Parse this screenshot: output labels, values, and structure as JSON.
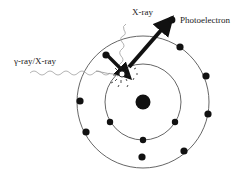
{
  "figure": {
    "background_color": "#ffffff",
    "ink_color": "#1a1a1a",
    "faint_ray_color": "#aaaaaa",
    "orbit_color": "#555555"
  },
  "labels": {
    "incident_photon": "γ-ray/X-ray",
    "emitted_photon": "X-ray",
    "photoelectron": "Photoelectron"
  },
  "legend": {
    "photoelectron_marker": "filled-dot"
  },
  "atom": {
    "nucleus": {
      "cx": 143,
      "cy": 102,
      "r": 7.5,
      "fill": "#111111"
    },
    "shells": [
      {
        "name": "inner-shell",
        "cx": 143,
        "cy": 102,
        "rx": 38,
        "ry": 38
      },
      {
        "name": "outer-shell",
        "cx": 143,
        "cy": 102,
        "rx": 66,
        "ry": 66
      }
    ],
    "inner_electrons": [
      {
        "cx": 175,
        "cy": 122,
        "r": 3.2
      },
      {
        "cx": 143,
        "cy": 140,
        "r": 3.2
      },
      {
        "cx": 110,
        "cy": 122,
        "r": 3.2
      }
    ],
    "outer_electrons": [
      {
        "cx": 180,
        "cy": 47,
        "r": 3.6
      },
      {
        "cx": 206,
        "cy": 76,
        "r": 3.6
      },
      {
        "cx": 208,
        "cy": 114,
        "r": 3.6
      },
      {
        "cx": 184,
        "cy": 151,
        "r": 3.6
      },
      {
        "cx": 142,
        "cy": 157,
        "r": 3.6
      },
      {
        "cx": 86,
        "cy": 132,
        "r": 3.6
      },
      {
        "cx": 80,
        "cy": 101,
        "r": 3.6
      },
      {
        "cx": 106,
        "cy": 55,
        "r": 3.6
      }
    ],
    "vacancy": {
      "cx": 122,
      "cy": 74,
      "r": 3.0,
      "label": "inner-shell-vacancy-hole"
    }
  },
  "rays": {
    "incident": {
      "name": "incident-gamma-xray-wave",
      "start_x": 30,
      "start_y": 72,
      "end_x": 118,
      "end_y": 75,
      "style": "wavy-gray-with-arrowhead"
    },
    "emitted": {
      "name": "emitted-characteristic-xray-wave",
      "start_x": 122,
      "start_y": 70,
      "end_x": 131,
      "end_y": 22,
      "style": "wavy-gray"
    },
    "electron_transition": {
      "name": "electron-transition-arrow",
      "start_x": 107,
      "start_y": 55,
      "end_x": 125,
      "end_y": 72,
      "style": "thick-black-arrow"
    },
    "photoelectron_ejection": {
      "name": "photoelectron-ejection-arrow",
      "start_x": 129,
      "start_y": 67,
      "end_x": 166,
      "end_y": 25,
      "style": "thick-black-arrow"
    }
  },
  "text_positions": {
    "incident_photon": {
      "x": 14,
      "y": 64
    },
    "emitted_photon": {
      "x": 132,
      "y": 14
    },
    "photoelectron": {
      "x": 180,
      "y": 23
    },
    "photoelectron_dot": {
      "x": 172,
      "y": 20,
      "r": 3.4
    }
  }
}
